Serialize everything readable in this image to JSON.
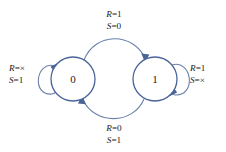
{
  "diagram": {
    "type": "state-transition-diagram",
    "title": "",
    "colors": {
      "edge": "#6b80ab",
      "node_stroke": "#4a649a",
      "node_fill": "#ffffff",
      "arrow": "#4a6494",
      "text": "#1a1a1a",
      "background": "#ffffff"
    },
    "states": [
      {
        "id": "s0",
        "label": "0",
        "cx": 73,
        "cy": 79,
        "r": 22
      },
      {
        "id": "s1",
        "label": "1",
        "cx": 155,
        "cy": 79,
        "r": 22
      }
    ],
    "transitions": [
      {
        "id": "t0to1",
        "from": "0",
        "to": "1",
        "shape": "arc-top",
        "label_lines": [
          {
            "var": "R",
            "eq": "=",
            "val": "1"
          },
          {
            "var": "S",
            "eq": "=",
            "val": "0"
          }
        ],
        "label_x": 114,
        "label_y": 14
      },
      {
        "id": "t1to0",
        "from": "1",
        "to": "0",
        "shape": "arc-bottom",
        "label_lines": [
          {
            "var": "R",
            "eq": "=",
            "val": "0"
          },
          {
            "var": "S",
            "eq": "=",
            "val": "1"
          }
        ],
        "label_x": 114,
        "label_y": 128
      },
      {
        "id": "t0self",
        "from": "0",
        "to": "0",
        "shape": "self-loop-left",
        "label_lines": [
          {
            "var": "R",
            "eq": "=",
            "val": "×"
          },
          {
            "var": "S",
            "eq": "=",
            "val": "1"
          }
        ],
        "label_x": 9,
        "label_y": 68
      },
      {
        "id": "t1self",
        "from": "1",
        "to": "1",
        "shape": "self-loop-right",
        "label_lines": [
          {
            "var": "R",
            "eq": "=",
            "val": "1"
          },
          {
            "var": "S",
            "eq": "=",
            "val": "×"
          }
        ],
        "label_x": 190,
        "label_y": 68
      }
    ]
  }
}
